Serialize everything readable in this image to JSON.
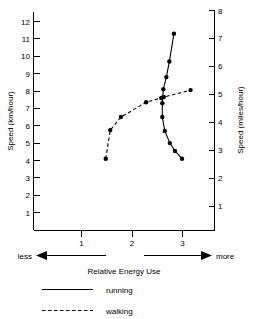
{
  "chart_data": {
    "type": "line",
    "title": "",
    "xlabel": "Relative Energy Use",
    "ylabel": "Speed (km/hour)",
    "ylabel_right": "Speed (miles/hour)",
    "xlim": [
      0.3,
      3.45
    ],
    "ylim": [
      0,
      12.6
    ],
    "ylim_right": [
      0,
      8.1
    ],
    "grid": false,
    "legend_position": "bottom",
    "x_ticks": [
      1,
      2,
      3
    ],
    "x_tick_labels": [
      "1",
      "2",
      "3"
    ],
    "y_ticks": [
      1,
      2,
      3,
      4,
      5,
      6,
      7,
      8,
      9,
      10,
      11,
      12
    ],
    "y_tick_labels": [
      "1",
      "2",
      "3",
      "4",
      "5",
      "6",
      "7",
      "8",
      "9",
      "10",
      "11",
      "12"
    ],
    "y_ticks_right": [
      1,
      2,
      3,
      4,
      5,
      6,
      7,
      8
    ],
    "y_tick_labels_right": [
      "1",
      "2",
      "3",
      "4",
      "5",
      "6",
      "7",
      "8"
    ],
    "x_axis_less_label": "less",
    "x_axis_more_label": "more",
    "series": [
      {
        "name": "running",
        "style": "solid",
        "x": [
          2.83,
          2.74,
          2.68,
          2.62,
          2.6,
          2.6,
          2.65,
          2.75,
          2.85,
          2.99
        ],
        "values": [
          11.3,
          9.7,
          8.8,
          8.1,
          7.3,
          6.5,
          5.7,
          5.0,
          4.55,
          4.1
        ]
      },
      {
        "name": "walking",
        "style": "dashed",
        "x": [
          1.48,
          1.57,
          1.78,
          2.28,
          2.58,
          2.63,
          3.16
        ],
        "values": [
          4.1,
          5.75,
          6.5,
          7.35,
          7.6,
          7.65,
          8.05
        ]
      }
    ]
  },
  "legend": {
    "entries": [
      {
        "label": "running",
        "style": "solid"
      },
      {
        "label": "walking",
        "style": "dashed"
      }
    ]
  }
}
